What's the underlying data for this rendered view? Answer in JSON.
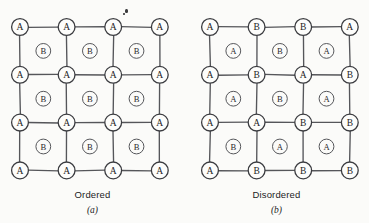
{
  "figure": {
    "background_color": "#fbfbf9",
    "line_color": "#55565a",
    "label_color": "#1d1d1f"
  },
  "panels": [
    {
      "id": "a",
      "caption_name": "Ordered",
      "caption_letter": "(a)",
      "grid": {
        "rows": 4,
        "cols": 4,
        "origin_x": 20,
        "origin_y": 27,
        "step_x": 46.6,
        "step_y": 47.8,
        "node_radius": 8.4,
        "inter_radius": 7.4
      },
      "nodes": [
        [
          "A",
          "A",
          "A",
          "A"
        ],
        [
          "A",
          "A",
          "A",
          "A"
        ],
        [
          "A",
          "A",
          "A",
          "A"
        ],
        [
          "A",
          "A",
          "A",
          "A"
        ]
      ],
      "interstitials": [
        [
          "B",
          "B",
          "B"
        ],
        [
          "B",
          "B",
          "B"
        ],
        [
          "B",
          "B",
          "B"
        ]
      ]
    },
    {
      "id": "b",
      "caption_name": "Disordered",
      "caption_letter": "(b)",
      "grid": {
        "rows": 4,
        "cols": 4,
        "origin_x": 26,
        "origin_y": 27,
        "step_x": 46.6,
        "step_y": 47.8,
        "node_radius": 8.4,
        "inter_radius": 7.4
      },
      "nodes": [
        [
          "A",
          "B",
          "B",
          "A"
        ],
        [
          "A",
          "B",
          "A",
          "B"
        ],
        [
          "A",
          "A",
          "B",
          "B"
        ],
        [
          "A",
          "B",
          "B",
          "B"
        ]
      ],
      "interstitials": [
        [
          "A",
          "B",
          "A"
        ],
        [
          "A",
          "B",
          "A"
        ],
        [
          "B",
          "A",
          "A"
        ]
      ]
    }
  ],
  "artifacts": [
    {
      "x": 125,
      "y": 9,
      "w": 3,
      "h": 4
    },
    {
      "x": 123,
      "y": 13,
      "w": 2,
      "h": 2
    }
  ]
}
